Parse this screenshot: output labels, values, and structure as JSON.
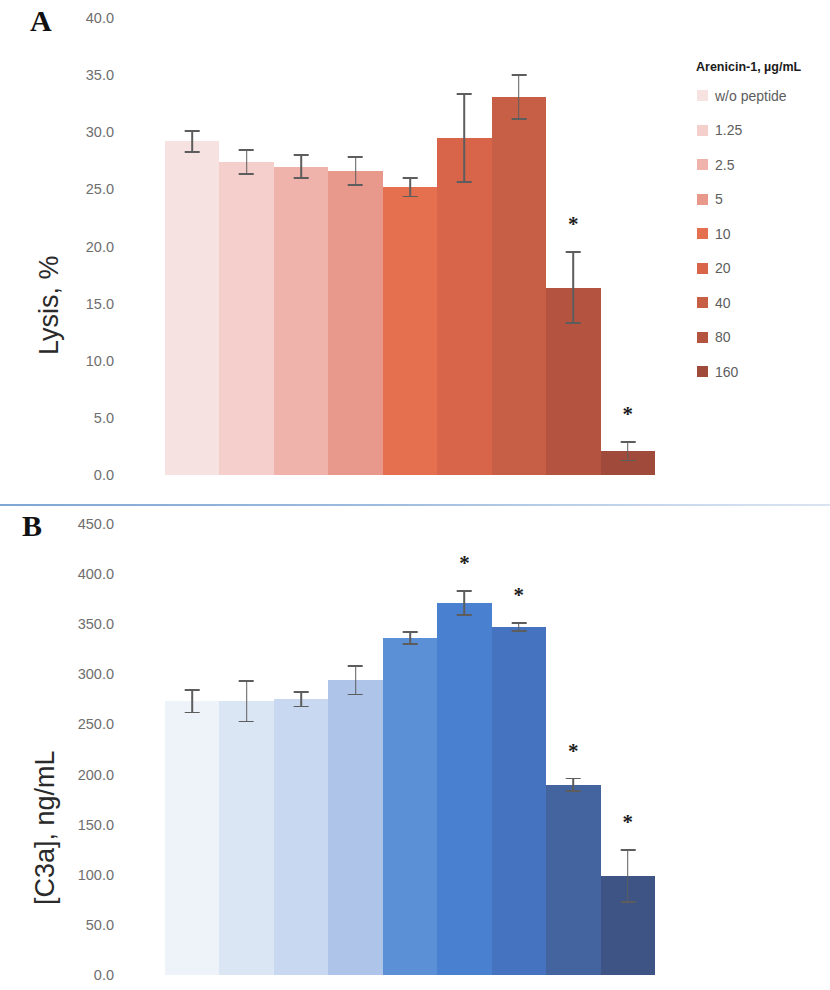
{
  "figure": {
    "divider_color": "#8fb0d6"
  },
  "panels": [
    {
      "id": "A",
      "letter": "A",
      "ylabel": "Lysis, %",
      "legend_title": "Arenicin-1, µg/mL",
      "tick_labels": [
        "40.0",
        "35.0",
        "30.0",
        "25.0",
        "20.0",
        "15.0",
        "10.0",
        "5.0",
        "0.0"
      ],
      "legend_items": [
        {
          "label": "w/o peptide",
          "color": "#f7e2e2"
        },
        {
          "label": "1.25",
          "color": "#f4cfcb"
        },
        {
          "label": "2.5",
          "color": "#efb3ac"
        },
        {
          "label": "5",
          "color": "#e9988c"
        },
        {
          "label": "10",
          "color": "#e4704f"
        },
        {
          "label": "20",
          "color": "#d86549"
        },
        {
          "label": "40",
          "color": "#c75f46"
        },
        {
          "label": "80",
          "color": "#b45440"
        },
        {
          "label": "160",
          "color": "#a04a3b"
        }
      ]
    },
    {
      "id": "B",
      "letter": "B",
      "ylabel": "[C3a], ng/mL",
      "legend_title": "Arenicin-1, µg/mL",
      "tick_labels": [
        "450.0",
        "400.0",
        "350.0",
        "300.0",
        "250.0",
        "200.0",
        "150.0",
        "100.0",
        "50.0",
        "0.0"
      ],
      "legend_items": [
        {
          "label": "w/o peptide",
          "color": "#eef3fa"
        },
        {
          "label": "1.25",
          "color": "#dbe6f5"
        },
        {
          "label": "2.5",
          "color": "#c7d8f0"
        },
        {
          "label": "5",
          "color": "#aec4e8"
        },
        {
          "label": "10",
          "color": "#5b8fd6"
        },
        {
          "label": "20",
          "color": "#4a80d0"
        },
        {
          "label": "40",
          "color": "#4573bf"
        },
        {
          "label": "80",
          "color": "#43649f"
        },
        {
          "label": "160",
          "color": "#3d5485"
        }
      ]
    }
  ],
  "chart_data": [
    {
      "type": "bar",
      "panel": "A",
      "title": "",
      "xlabel": "Arenicin-1, µg/mL",
      "ylabel": "Lysis, %",
      "ylim": [
        0,
        40
      ],
      "yticks": [
        0,
        5,
        10,
        15,
        20,
        25,
        30,
        35,
        40
      ],
      "grid": false,
      "legend_position": "right",
      "categories": [
        "w/o peptide",
        "1.25",
        "2.5",
        "5",
        "10",
        "20",
        "40",
        "80",
        "160"
      ],
      "values": [
        29.2,
        27.4,
        27.0,
        26.6,
        25.2,
        29.5,
        33.1,
        16.4,
        2.1
      ],
      "errors": [
        1.0,
        1.1,
        1.1,
        1.3,
        0.9,
        3.9,
        2.0,
        3.2,
        0.9
      ],
      "colors": [
        "#f7e2e2",
        "#f4cfcb",
        "#efb3ac",
        "#e9988c",
        "#e4704f",
        "#d86549",
        "#c75f46",
        "#b45440",
        "#a04a3b"
      ],
      "annotations": [
        {
          "category": "80",
          "text": "*"
        },
        {
          "category": "160",
          "text": "*"
        }
      ]
    },
    {
      "type": "bar",
      "panel": "B",
      "title": "",
      "xlabel": "Arenicin-1, µg/mL",
      "ylabel": "[C3a], ng/mL",
      "ylim": [
        0,
        450
      ],
      "yticks": [
        0,
        50,
        100,
        150,
        200,
        250,
        300,
        350,
        400,
        450
      ],
      "grid": false,
      "legend_position": "right",
      "categories": [
        "w/o peptide",
        "1.25",
        "2.5",
        "5",
        "10",
        "20",
        "40",
        "80",
        "160"
      ],
      "values": [
        273,
        273,
        275,
        294,
        336,
        371,
        347,
        190,
        99
      ],
      "errors": [
        12,
        21,
        8,
        15,
        7,
        13,
        5,
        7,
        27
      ],
      "colors": [
        "#eef3fa",
        "#dbe6f5",
        "#c7d8f0",
        "#aec4e8",
        "#5b8fd6",
        "#4a80d0",
        "#4573bf",
        "#43649f",
        "#3d5485"
      ],
      "annotations": [
        {
          "category": "20",
          "text": "*"
        },
        {
          "category": "40",
          "text": "*"
        },
        {
          "category": "80",
          "text": "*"
        },
        {
          "category": "160",
          "text": "*"
        }
      ]
    }
  ]
}
